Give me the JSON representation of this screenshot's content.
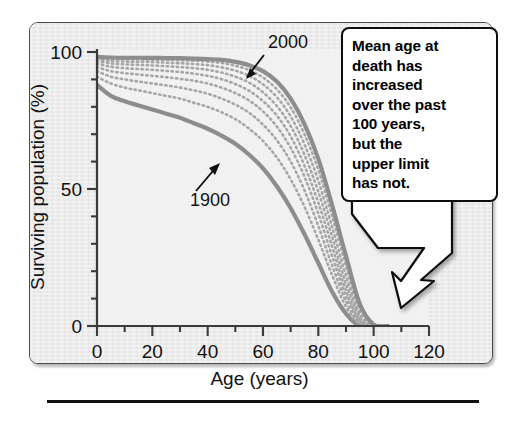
{
  "figure": {
    "panel_background": "#ebebeb",
    "plot_background": "#f1f1f1",
    "frame_color": "#4a4a4a"
  },
  "callout": {
    "name": "annotation-callout",
    "text": "Mean age at death has increased over the past 100 years, but the upper limit has not.",
    "lines": [
      "Mean age at",
      "death has",
      "increased",
      "over the past",
      "100 years,",
      "but the",
      "upper limit",
      "has not."
    ],
    "border_color": "#0d0d0d",
    "fill_color": "#ffffff"
  },
  "chart_data": {
    "type": "line",
    "title": "",
    "xlabel": "Age (years)",
    "ylabel": "Surviving population (%)",
    "xlim": [
      0,
      120
    ],
    "ylim": [
      0,
      100
    ],
    "xticks": [
      0,
      20,
      40,
      60,
      80,
      100,
      120
    ],
    "xtick_labels": [
      "0",
      "20",
      "40",
      "60",
      "80",
      "100",
      "120"
    ],
    "xminor_step": 10,
    "yticks": [
      0,
      50,
      100
    ],
    "ytick_labels": [
      "0",
      "50",
      "100"
    ],
    "yminor_step": 10,
    "grid": false,
    "legend": "none",
    "annotations": [
      {
        "label": "2000",
        "target_series": "2000",
        "arrow": "down-left"
      },
      {
        "label": "1900",
        "target_series": "1900",
        "arrow": "up-right"
      }
    ],
    "series_color_solid": "#8d8d8d",
    "series_color_dotted": "#a6a6a6",
    "x": [
      0,
      5,
      10,
      15,
      20,
      25,
      30,
      35,
      40,
      45,
      50,
      55,
      60,
      65,
      70,
      75,
      80,
      85,
      90,
      95,
      100,
      105
    ],
    "series": [
      {
        "name": "1900",
        "style": "solid",
        "values": [
          88,
          84,
          82,
          80.5,
          79,
          77.5,
          76,
          74,
          72,
          69.5,
          66.5,
          62.5,
          57.5,
          51,
          43,
          33.5,
          23,
          12.5,
          4.5,
          0,
          0,
          0
        ]
      },
      {
        "name": "curve-2",
        "style": "dotted",
        "values": [
          91,
          88.5,
          87,
          86,
          85,
          84,
          83,
          81.5,
          80,
          78,
          75.5,
          72,
          67.5,
          61.5,
          53.5,
          43.5,
          31.5,
          18.5,
          7,
          0.5,
          0,
          0
        ]
      },
      {
        "name": "curve-3",
        "style": "dotted",
        "values": [
          93,
          91,
          90,
          89.2,
          88.5,
          87.8,
          87,
          86,
          84.8,
          83,
          80.8,
          77.8,
          73.5,
          67.8,
          60,
          49.5,
          36.5,
          22,
          9,
          1,
          0,
          0
        ]
      },
      {
        "name": "curve-4",
        "style": "dotted",
        "values": [
          94.5,
          93,
          92.3,
          91.8,
          91.3,
          90.8,
          90.2,
          89.5,
          88.5,
          87,
          85,
          82.3,
          78.3,
          72.8,
          65,
          54.5,
          41,
          25.5,
          11,
          1.5,
          0,
          0
        ]
      },
      {
        "name": "curve-5",
        "style": "dotted",
        "values": [
          95.8,
          94.6,
          94.1,
          93.8,
          93.5,
          93.1,
          92.7,
          92.1,
          91.3,
          90.1,
          88.3,
          85.8,
          82.1,
          76.8,
          69.2,
          58.5,
          45,
          29,
          13,
          2,
          0,
          0
        ]
      },
      {
        "name": "curve-6",
        "style": "dotted",
        "values": [
          96.7,
          95.8,
          95.5,
          95.3,
          95.1,
          94.8,
          94.5,
          94.1,
          93.5,
          92.5,
          91,
          88.8,
          85.3,
          80.3,
          73,
          62.5,
          49,
          32.5,
          15.5,
          3,
          0,
          0
        ]
      },
      {
        "name": "curve-7",
        "style": "dotted",
        "values": [
          97.3,
          96.7,
          96.5,
          96.4,
          96.3,
          96.1,
          95.9,
          95.6,
          95.2,
          94.4,
          93.2,
          91.3,
          88.2,
          83.5,
          76.5,
          66.3,
          53,
          36,
          18.5,
          4,
          0,
          0
        ]
      },
      {
        "name": "curve-8",
        "style": "dotted",
        "values": [
          97.8,
          97.4,
          97.3,
          97.25,
          97.2,
          97.1,
          97,
          96.8,
          96.5,
          96,
          95,
          93.4,
          90.7,
          86.4,
          79.8,
          70,
          57,
          40,
          22,
          5.5,
          0,
          0
        ]
      },
      {
        "name": "2000",
        "style": "solid",
        "values": [
          98.2,
          98,
          97.9,
          97.9,
          97.85,
          97.8,
          97.75,
          97.6,
          97.4,
          97.1,
          96.4,
          95.2,
          93,
          89.2,
          83,
          73.7,
          61,
          44,
          25.5,
          8,
          0.5,
          0
        ]
      }
    ]
  },
  "axis_texts": {
    "x_label": "Age (years)",
    "y_label": "Surviving population (%)"
  }
}
